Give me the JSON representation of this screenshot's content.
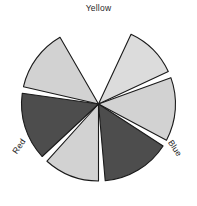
{
  "figure": {
    "type": "color-wheel-sector-diagram",
    "background_color": "#ffffff",
    "title": ""
  },
  "labels": {
    "yellow": "Yellow",
    "red": "Red",
    "blue": "Blue"
  },
  "wheel": {
    "center_x": 98.5,
    "center_y": 104,
    "radius": 77,
    "sector_count": 6,
    "gap_degrees": 9,
    "outline_color": "#1a1a1a",
    "outline_width": 1.1,
    "light_fill": "#d2d2d2",
    "pale_fill": "#dcdcdc",
    "dark_fill": "#4d4d4d",
    "gap_fill": "#ffffff"
  },
  "sectors": [
    {
      "id": "sector-top",
      "name": "Yellow",
      "tone": "pale",
      "fill": "#dcdcdc",
      "start_angle": -65,
      "end_angle": -25
    },
    {
      "id": "sector-upper-right",
      "name": "upper-right",
      "tone": "light",
      "fill": "#d2d2d2",
      "start_angle": -20,
      "end_angle": 28
    },
    {
      "id": "sector-lower-right",
      "name": "Blue",
      "tone": "dark",
      "fill": "#4d4d4d",
      "start_angle": 33,
      "end_angle": 85
    },
    {
      "id": "sector-bottom",
      "name": "bottom",
      "tone": "light",
      "fill": "#d2d2d2",
      "start_angle": 90,
      "end_angle": 132
    },
    {
      "id": "sector-lower-left",
      "name": "Red",
      "tone": "dark",
      "fill": "#4d4d4d",
      "start_angle": 137,
      "end_angle": 188
    },
    {
      "id": "sector-upper-left",
      "name": "upper-left",
      "tone": "light",
      "fill": "#d2d2d2",
      "start_angle": 193,
      "end_angle": 240
    }
  ]
}
